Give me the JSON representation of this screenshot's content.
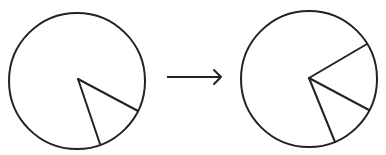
{
  "diagram": {
    "stroke_color": "#222222",
    "background": "#ffffff",
    "left_circle": {
      "cx": 77,
      "cy": 81,
      "r": 68,
      "vertex": [
        78,
        79
      ],
      "radii_ends": [
        [
          138,
          111
        ],
        [
          100,
          144
        ]
      ]
    },
    "arrow": {
      "x1": 167,
      "y1": 77,
      "x2": 221,
      "y2": 77,
      "glyph": "right-arrow"
    },
    "right_circle": {
      "cx": 309,
      "cy": 79,
      "r": 68,
      "vertex": [
        309,
        78
      ],
      "radii_ends": [
        [
          367,
          44
        ],
        [
          369,
          110
        ],
        [
          335,
          142
        ]
      ]
    }
  }
}
